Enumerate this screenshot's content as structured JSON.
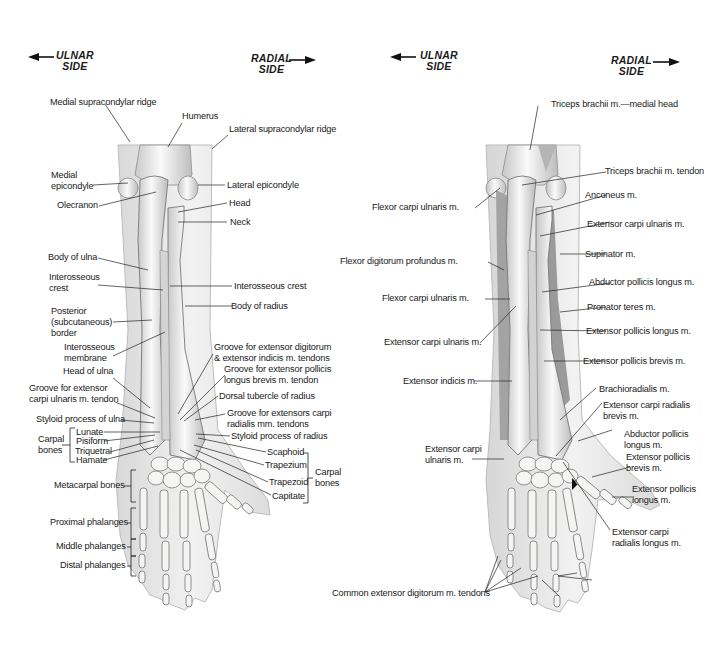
{
  "figure": {
    "colors": {
      "background": "#ffffff",
      "skin": "#ececec",
      "bone": "#f4f4f2",
      "bone_shadow": "#b9b9b9",
      "muscle": "#9c9c9c",
      "leader": "#222222"
    }
  },
  "left_panel": {
    "orientation": {
      "ulnar": {
        "line1": "ULNAR",
        "line2": "SIDE",
        "arrow": "left-arrow"
      },
      "radial": {
        "line1": "RADIAL",
        "line2": "SIDE",
        "arrow": "right-arrow"
      }
    },
    "labels": {
      "medial_supracondylar_ridge": "Medial supracondylar ridge",
      "humerus": "Humerus",
      "lateral_supracondylar_ridge": "Lateral supracondylar ridge",
      "medial_epicondyle_1": "Medial",
      "medial_epicondyle_2": "epicondyle",
      "lateral_epicondyle": "Lateral epicondyle",
      "olecranon": "Olecranon",
      "head": "Head",
      "neck": "Neck",
      "body_of_ulna": "Body of ulna",
      "interosseous_crest_l1": "Interosseous",
      "interosseous_crest_l2": "crest",
      "interosseous_crest_right": "Interosseous crest",
      "body_of_radius": "Body of radius",
      "posterior_border_1": "Posterior",
      "posterior_border_2": "(subcutaneous)",
      "posterior_border_3": "border",
      "interosseous_membrane_1": "Interosseous",
      "interosseous_membrane_2": "membrane",
      "groove_ext_digitorum_1": "Groove for extensor digitorum",
      "groove_ext_digitorum_2": "& extensor indicis m. tendons",
      "head_of_ulna": "Head of ulna",
      "groove_epl_1": "Groove for extensor pollicis",
      "groove_epl_2": "longus brevis m. tendon",
      "groove_ecu_1": "Groove for extensor",
      "groove_ecu_2": "carpi ulnaris m. tendon",
      "dorsal_tubercle": "Dorsal tubercle of radius",
      "styloid_ulna": "Styloid process of ulna",
      "groove_ecr_1": "Groove for extensors carpi",
      "groove_ecr_2": "radialis mm. tendons",
      "lunate": "Lunate",
      "styloid_radius": "Styloid process of radius",
      "carpal_bones_left_1": "Carpal",
      "carpal_bones_left_2": "bones",
      "pisiform": "Pisiform",
      "triquetral": "Triquetral",
      "hamate": "Hamate",
      "scaphoid": "Scaphoid",
      "trapezium": "Trapezium",
      "trapezoid": "Trapezoid",
      "capitate": "Capitate",
      "carpal_bones_right_1": "Carpal",
      "carpal_bones_right_2": "bones",
      "metacarpal_bones": "Metacarpal bones",
      "proximal_phalanges": "Proximal phalanges",
      "middle_phalanges": "Middle phalanges",
      "distal_phalanges": "Distal phalanges"
    }
  },
  "right_panel": {
    "orientation": {
      "ulnar": {
        "line1": "ULNAR",
        "line2": "SIDE",
        "arrow": "left-arrow"
      },
      "radial": {
        "line1": "RADIAL",
        "line2": "SIDE",
        "arrow": "right-arrow"
      }
    },
    "labels": {
      "triceps_medial_head": "Triceps brachii m.—medial head",
      "triceps_tendon": "Triceps brachii m. tendon",
      "fcu_upper": "Flexor carpi ulnaris m.",
      "anconeus": "Anconeus m.",
      "ecu_upper": "Extensor carpi ulnaris m.",
      "fdp": "Flexor digitorum profundus m.",
      "supinator": "Supinator m.",
      "apl_upper": "Abductor pollicis longus m.",
      "fcu_lower": "Flexor carpi ulnaris m.",
      "pronator_teres": "Pronator teres m.",
      "epl_upper": "Extensor pollicis longus m.",
      "ecu_mid": "Extensor carpi ulnaris m.",
      "epb_upper": "Extensor pollicis brevis m.",
      "extensor_indicis": "Extensor indicis m.",
      "brachioradialis": "Brachioradialis m.",
      "ecrb_1": "Extensor carpi radialis",
      "ecrb_2": "brevis m.",
      "apl_lower_1": "Abductor pollicis",
      "apl_lower_2": "longus m.",
      "ecu_lower_1": "Extensor carpi",
      "ecu_lower_2": "ulnaris m.",
      "epb_lower_1": "Extensor pollicis",
      "epb_lower_2": "brevis m.",
      "epl_lower_1": "Extensor pollicis",
      "epl_lower_2": "longus m.",
      "ecrl_1": "Extensor carpi",
      "ecrl_2": "radialis longus m.",
      "common_extensor": "Common extensor digitorum m. tendons"
    }
  }
}
